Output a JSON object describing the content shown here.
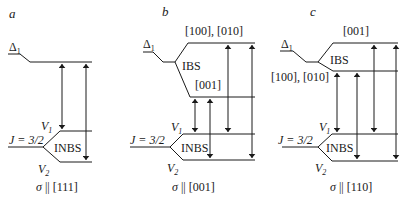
{
  "panels": [
    {
      "id": "a",
      "letter": "a",
      "caption_sigma": "σ",
      "caption_rest": " || [111]",
      "delta_label": "Δ",
      "delta_sub": "1",
      "j_label": "J = 3/2",
      "v1_label": "V",
      "v1_sub": "1",
      "v2_label": "V",
      "v2_sub": "2",
      "inbs_label": "INBS",
      "ibs_label": null,
      "upper_dir_label": null,
      "lower_dir_label": null
    },
    {
      "id": "b",
      "letter": "b",
      "caption_sigma": "σ",
      "caption_rest": " || [001]",
      "delta_label": "Δ",
      "delta_sub": "1",
      "j_label": "J = 3/2",
      "v1_label": "V",
      "v1_sub": "1",
      "v2_label": "V",
      "v2_sub": "2",
      "inbs_label": "INBS",
      "ibs_label": "IBS",
      "upper_dir_label": "[100], [010]",
      "lower_dir_label": "[001]"
    },
    {
      "id": "c",
      "letter": "c",
      "caption_sigma": "σ",
      "caption_rest": " || [110]",
      "delta_label": "Δ",
      "delta_sub": "1",
      "j_label": "J = 3/2",
      "v1_label": "V",
      "v1_sub": "1",
      "v2_label": "V",
      "v2_sub": "2",
      "inbs_label": "INBS",
      "ibs_label": "IBS",
      "upper_dir_label": "[001]",
      "lower_dir_label": "[100], [010]"
    }
  ],
  "colors": {
    "line": "#1a1a1a",
    "background": "#ffffff"
  }
}
